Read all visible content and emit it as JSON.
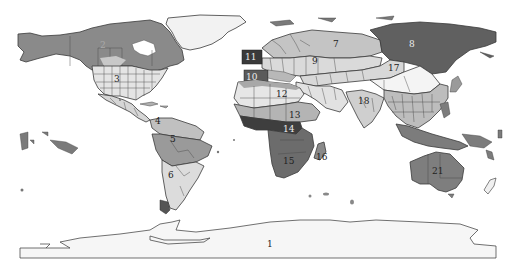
{
  "map": {
    "type": "world-region-map",
    "projection": "equirectangular",
    "color_scheme": "grayscale",
    "colors": {
      "background": "#ffffff",
      "ice": "#f4f4f4",
      "very_light": "#e6e6e6",
      "light": "#cfcfcf",
      "medium_light": "#b8b8b8",
      "medium": "#9a9a9a",
      "medium_dark": "#808080",
      "dark": "#5e5e5e",
      "very_dark": "#404040",
      "border": "#3a3a3a"
    },
    "regions": [
      {
        "id": "1",
        "label": "1",
        "area": "Antarctica"
      },
      {
        "id": "2",
        "label": "2",
        "area": "Northern North America (Canada/Alaska)"
      },
      {
        "id": "3",
        "label": "3",
        "area": "Continental United States"
      },
      {
        "id": "4",
        "label": "4",
        "area": "Northern South America"
      },
      {
        "id": "5",
        "label": "5",
        "area": "Amazon Basin"
      },
      {
        "id": "6",
        "label": "6",
        "area": "Southern South America"
      },
      {
        "id": "7",
        "label": "7",
        "area": "Northern Europe / Western Russia"
      },
      {
        "id": "8",
        "label": "8",
        "area": "Siberia"
      },
      {
        "id": "9",
        "label": "9",
        "area": "Central Asia / Eastern Europe"
      },
      {
        "id": "10",
        "label": "10",
        "area": "Iberia / Mediterranean"
      },
      {
        "id": "11",
        "label": "11",
        "area": "British Isles"
      },
      {
        "id": "12",
        "label": "12",
        "area": "Sahara / North Africa"
      },
      {
        "id": "13",
        "label": "13",
        "area": "Sahel / East Africa"
      },
      {
        "id": "14",
        "label": "14",
        "area": "Central / West Africa"
      },
      {
        "id": "15",
        "label": "15",
        "area": "Southern Africa"
      },
      {
        "id": "16",
        "label": "16",
        "area": "Madagascar"
      },
      {
        "id": "17",
        "label": "17",
        "area": "Mongolia / Northern China"
      },
      {
        "id": "18",
        "label": "18",
        "area": "Indian Subcontinent"
      },
      {
        "id": "21",
        "label": "21",
        "area": "Australia"
      }
    ]
  },
  "labels": {
    "r1": "1",
    "r2": "2",
    "r3": "3",
    "r4": "4",
    "r5": "5",
    "r6": "6",
    "r7": "7",
    "r8": "8",
    "r9": "9",
    "r10": "10",
    "r11": "11",
    "r12": "12",
    "r13": "13",
    "r14": "14",
    "r15": "15",
    "r16": "16",
    "r17": "17",
    "r18": "18",
    "r21": "21"
  }
}
